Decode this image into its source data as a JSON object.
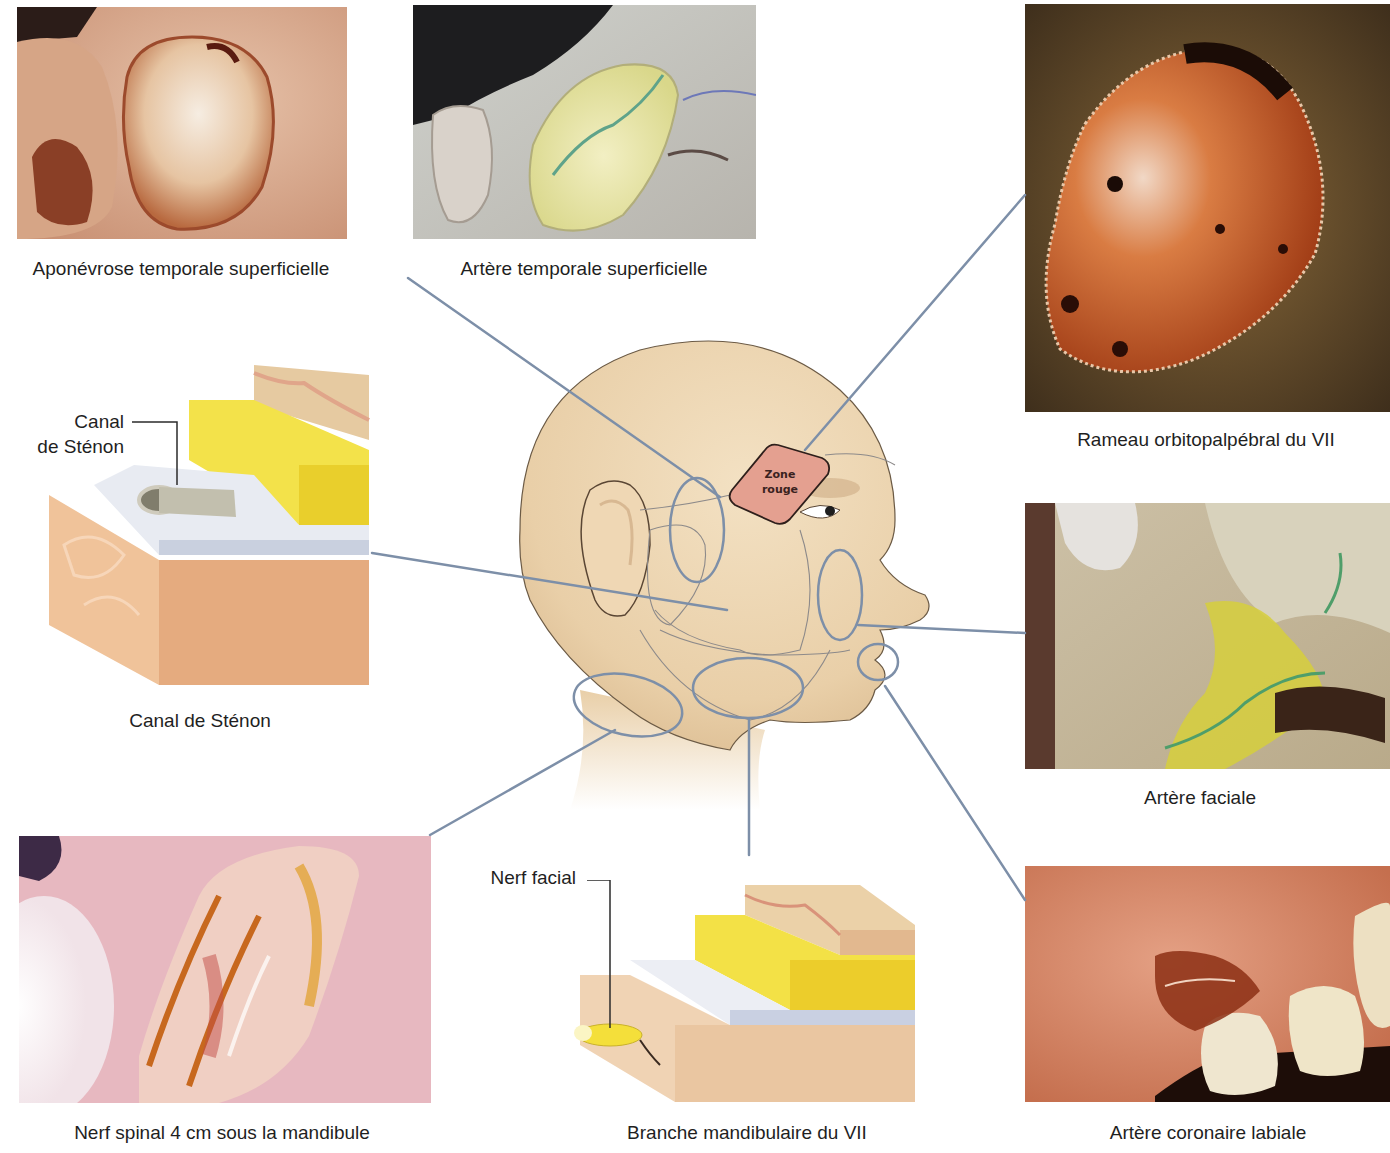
{
  "figure": {
    "center": {
      "illustration": "head-profile",
      "zone_label_line1": "Zone",
      "zone_label_line2": "rouge"
    },
    "panels": [
      {
        "id": "aponevrose",
        "type": "photo",
        "caption": "Aponévrose temporale superficielle"
      },
      {
        "id": "artere-temporale",
        "type": "photo",
        "caption": "Artère temporale superficielle"
      },
      {
        "id": "rameau-orbito",
        "type": "photo",
        "caption": "Rameau orbitopalpébral du VII"
      },
      {
        "id": "canal-stenon",
        "type": "illustration",
        "caption": "Canal de Sténon",
        "callout": [
          "Canal",
          "de Sténon"
        ]
      },
      {
        "id": "artere-faciale",
        "type": "photo",
        "caption": "Artère faciale"
      },
      {
        "id": "nerf-spinal",
        "type": "photo",
        "caption": "Nerf spinal 4 cm sous la mandibule"
      },
      {
        "id": "branche-mandibulaire",
        "type": "illustration",
        "caption": "Branche mandibulaire du VII",
        "callout": [
          "Nerf facial"
        ]
      },
      {
        "id": "artere-coronaire",
        "type": "photo",
        "caption": "Artère coronaire labiale"
      }
    ],
    "colors": {
      "leader_line": "#7d8fa8",
      "skin": "#efd9b8",
      "zone_rouge": "#e3a08e",
      "fat_yellow": "#f2e03a",
      "fascia": "#dfe3ec",
      "muscle": "#e9b98f"
    }
  }
}
